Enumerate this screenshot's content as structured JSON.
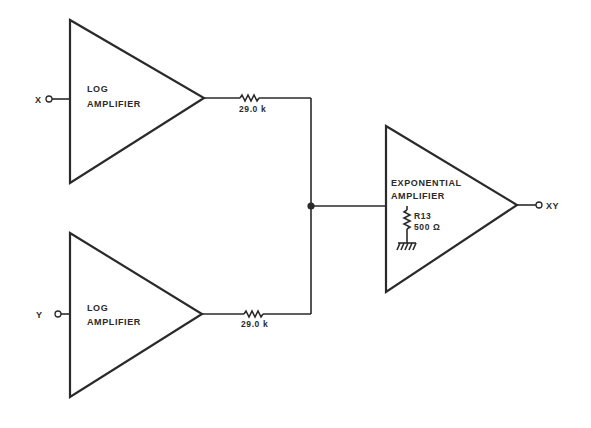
{
  "diagram": {
    "type": "circuit-block-diagram",
    "inputs": [
      {
        "id": "x",
        "label": "X"
      },
      {
        "id": "y",
        "label": "Y"
      }
    ],
    "output": {
      "id": "xy",
      "label": "XY"
    },
    "amplifiers": [
      {
        "id": "log-x",
        "line1": "LOG",
        "line2": "AMPLIFIER"
      },
      {
        "id": "log-y",
        "line1": "LOG",
        "line2": "AMPLIFIER"
      },
      {
        "id": "exp",
        "line1": "EXPONENTIAL",
        "line2": "AMPLIFIER"
      }
    ],
    "resistors": [
      {
        "id": "r-top",
        "value": "29.0 k"
      },
      {
        "id": "r-bottom",
        "value": "29.0 k"
      },
      {
        "id": "r13",
        "name": "R13",
        "value": "500 Ω"
      }
    ],
    "colors": {
      "ink": "#2a2a2a",
      "background": "#ffffff"
    }
  }
}
